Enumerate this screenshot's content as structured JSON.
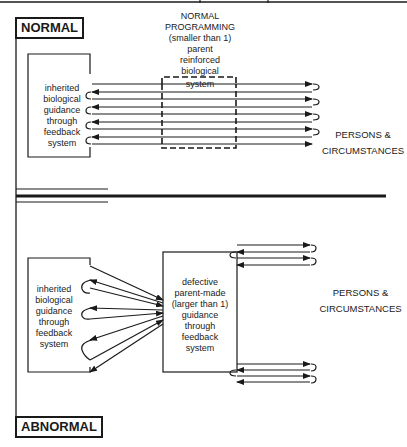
{
  "normal": {
    "section_label": "NORMAL",
    "programming_label": [
      "NORMAL",
      "PROGRAMMING",
      "(smaller than 1)",
      "parent",
      "reinforced",
      "biological",
      "system"
    ],
    "inherited_label": [
      "inherited",
      "biological",
      "guidance",
      "through",
      "feedback",
      "system"
    ],
    "persons_label": [
      "PERSONS &",
      "CIRCUMSTANCES"
    ]
  },
  "abnormal": {
    "section_label": "ABNORMAL",
    "inherited_label": [
      "inherited",
      "biological",
      "guidance",
      "through",
      "feedback",
      "system"
    ],
    "defective_label": [
      "defective",
      "parent-made",
      "(larger than 1)",
      "guidance",
      "through",
      "feedback",
      "system"
    ],
    "persons_label": [
      "PERSONS &",
      "CIRCUMSTANCES"
    ]
  },
  "colors": {
    "ink": "#1a1a1a",
    "background": "#ffffff"
  }
}
